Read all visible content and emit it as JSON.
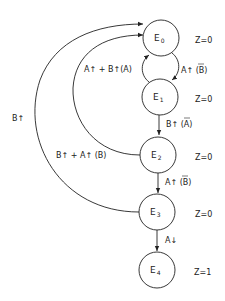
{
  "diagram": {
    "type": "state-diagram",
    "nodes": [
      {
        "id": "E0",
        "letter": "E",
        "sub": "0",
        "output": "Z=0"
      },
      {
        "id": "E1",
        "letter": "E",
        "sub": "1",
        "output": "Z=0"
      },
      {
        "id": "E2",
        "letter": "E",
        "sub": "2",
        "output": "Z=0"
      },
      {
        "id": "E3",
        "letter": "E",
        "sub": "3",
        "output": "Z=0"
      },
      {
        "id": "E4",
        "letter": "E",
        "sub": "4",
        "output": "Z=1"
      }
    ],
    "edges": [
      {
        "from": "E0",
        "to": "E1",
        "label_main": "A↑ (",
        "label_bar": "B",
        "label_end": ")"
      },
      {
        "from": "E1",
        "to": "E0",
        "label": "A↑ + B↑(A)"
      },
      {
        "from": "E1",
        "to": "E2",
        "label_main": "B↑ (",
        "label_bar": "A",
        "label_end": ")"
      },
      {
        "from": "E2",
        "to": "E0",
        "label": "B↑ + A↑ (B)"
      },
      {
        "from": "E2",
        "to": "E3",
        "label_main": "A↑ (",
        "label_bar": "B",
        "label_end": ")"
      },
      {
        "from": "E3",
        "to": "E0",
        "label": "B↑"
      },
      {
        "from": "E3",
        "to": "E4",
        "label": "A↓"
      }
    ]
  }
}
